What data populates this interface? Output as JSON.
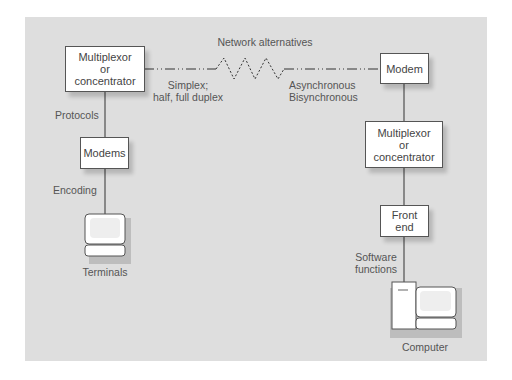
{
  "diagram": {
    "title": "Network alternatives",
    "nodes": {
      "left_mux": {
        "line1": "Multiplexor",
        "line2": "or",
        "line3": "concentrator"
      },
      "left_modems": {
        "label": "Modems"
      },
      "terminals": {
        "label": "Terminals",
        "icon": "terminal-icon"
      },
      "right_modem": {
        "label": "Modem"
      },
      "right_mux": {
        "line1": "Multiplexor",
        "line2": "or",
        "line3": "concentrator"
      },
      "front_end": {
        "line1": "Front",
        "line2": "end"
      },
      "computer": {
        "label": "Computer",
        "icon": "computer-icon"
      }
    },
    "annotations": {
      "simplex_line1": "Simplex;",
      "simplex_line2": "half, full duplex",
      "async_line1": "Asynchronous",
      "async_line2": "Bisynchronous",
      "protocols": "Protocols",
      "encoding": "Encoding",
      "software_line1": "Software",
      "software_line2": "functions"
    },
    "colors": {
      "panel": "#dedede",
      "box": "#ffffff",
      "line": "#333333"
    }
  }
}
